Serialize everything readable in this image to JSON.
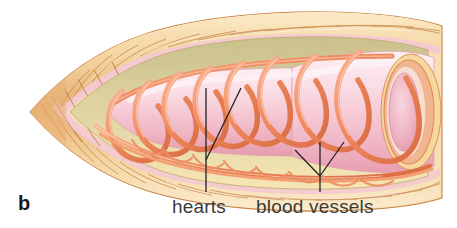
{
  "figure": {
    "panel_letter": "b",
    "background_color": "#ffffff"
  },
  "labels": [
    {
      "id": "hearts",
      "text": "hearts",
      "x": 172,
      "y": 196
    },
    {
      "id": "blood_vessels",
      "text": "blood vessels",
      "x": 256,
      "y": 196
    }
  ],
  "leader_lines": {
    "hearts": [
      {
        "name": "hearts-leader-vertical",
        "points": "206,88 206,192"
      },
      {
        "name": "hearts-leader-diagonal",
        "points": "241,88 206,160"
      }
    ],
    "blood_vessels": [
      {
        "name": "vessels-leader-stem",
        "points": "320,142 320,192"
      },
      {
        "name": "vessels-leader-left-prong",
        "points": "295,150 320,176"
      },
      {
        "name": "vessels-leader-right-prong",
        "points": "344,142 320,176"
      }
    ],
    "color": "#222222",
    "width": 1.3
  },
  "colors": {
    "body_wall_ridge_light": "#f6dcae",
    "body_wall_ridge_mid": "#e9b97a",
    "body_wall_ridge_dark": "#d9975a",
    "body_wall_outline": "#c9844a",
    "peritoneum_pink": "#f3c9d2",
    "coelom_olive": "#cfc591",
    "coelom_cream": "#f2e3b4",
    "gut_pink_light": "#fbe0e6",
    "gut_pink_mid": "#f3bdc9",
    "gut_pink_deep": "#e9a3b4",
    "vessel_salmon": "#f08a60",
    "vessel_salmon_light": "#f6a985",
    "vessel_salmon_dark": "#d9683f",
    "lumen_pink": "#f0b9c6",
    "text_gray": "#3a3a3a",
    "panel_letter_color": "#1a1a1a"
  },
  "anatomy": {
    "hearts_count": 7,
    "heart_description": "aortic arch loops encircling the gut",
    "dorsal_vessel": "dorsal blood vessel running along top of gut",
    "ventral_vessels": "ventral blood vessels running along floor of coelom",
    "posterior_opening": "cut end of gut showing pink lumen",
    "segments_visible": true
  }
}
